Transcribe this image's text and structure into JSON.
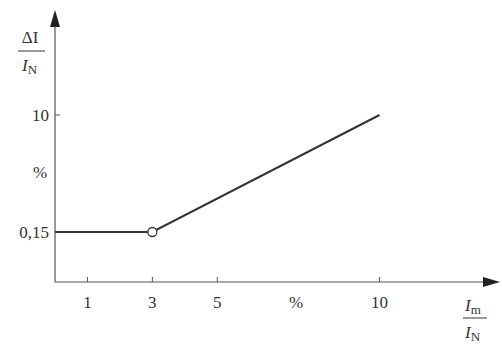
{
  "chart_data": {
    "type": "line",
    "title": "",
    "ylabel": {
      "numerator": "ΔI",
      "denominator": "I",
      "denominator_sub": "N",
      "unit": "%"
    },
    "xlabel": {
      "numerator": "I",
      "numerator_sub": "m",
      "denominator": "I",
      "denominator_sub": "N",
      "unit": "%"
    },
    "x_ticks": [
      1,
      3,
      5,
      10
    ],
    "x_tick_labels": [
      "1",
      "3",
      "5",
      "10"
    ],
    "x_unit_label": "%",
    "y_ticks": [
      0.15,
      10
    ],
    "y_tick_labels": [
      "0,15",
      "10"
    ],
    "y_unit_label": "%",
    "xlim": [
      0,
      12.8
    ],
    "y_scale": "schematic (non-linear)",
    "grid": false,
    "series": [
      {
        "name": "characteristic",
        "x": [
          0,
          3,
          10
        ],
        "y": [
          0.15,
          0.15,
          10
        ],
        "markers": [
          {
            "x": 3,
            "y": 0.15,
            "style": "open-circle"
          }
        ]
      }
    ],
    "colors": {
      "line": "#333333",
      "axis": "#555555",
      "text": "#333333"
    }
  }
}
